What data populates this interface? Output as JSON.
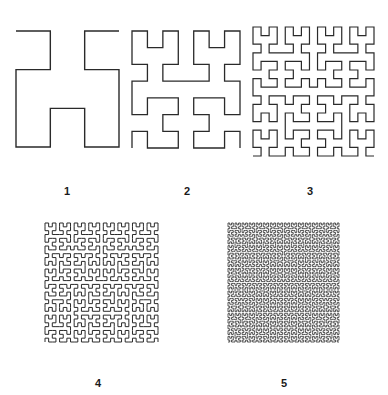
{
  "figure": {
    "stroke_color": "#2a2a2a",
    "background": "#ffffff",
    "panels": [
      {
        "label": "1",
        "order": 2,
        "bbox": [
          16,
          31,
          119,
          147
        ],
        "opening": "top",
        "stroke_width": 1.4,
        "label_pos": [
          67,
          186
        ]
      },
      {
        "label": "2",
        "order": 3,
        "bbox": [
          132,
          31,
          240,
          148
        ],
        "opening": "bottom",
        "stroke_width": 1.3,
        "label_pos": [
          187,
          186
        ]
      },
      {
        "label": "3",
        "order": 4,
        "bbox": [
          253,
          27,
          374,
          156
        ],
        "opening": "bottom",
        "stroke_width": 1.2,
        "label_pos": [
          310,
          186
        ]
      },
      {
        "label": "4",
        "order": 5,
        "bbox": [
          45,
          223,
          158,
          342
        ],
        "opening": "bottom",
        "stroke_width": 1.0,
        "label_pos": [
          98,
          378
        ]
      },
      {
        "label": "5",
        "order": 6,
        "bbox": [
          228,
          223,
          339,
          342
        ],
        "opening": "bottom",
        "stroke_width": 0.8,
        "label_pos": [
          284,
          378
        ]
      }
    ]
  }
}
